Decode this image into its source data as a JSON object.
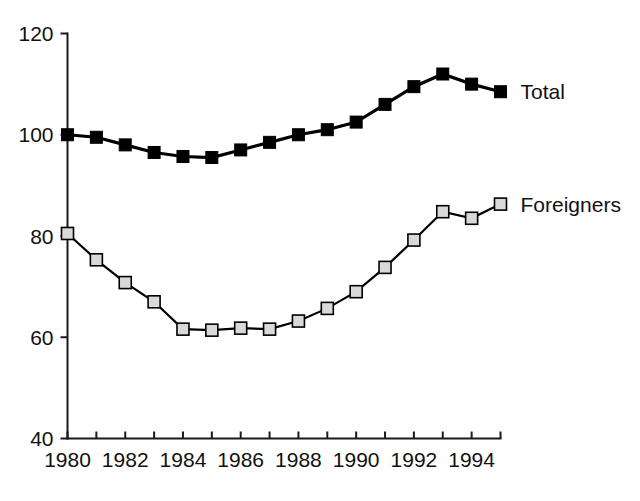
{
  "chart_data": {
    "type": "line",
    "title": "",
    "subtitle": "",
    "xlabel": "",
    "ylabel": "",
    "xlim": [
      1980,
      1995
    ],
    "ylim": [
      40,
      120
    ],
    "yticks": [
      40,
      60,
      80,
      100,
      120
    ],
    "ytick_labels": [
      "40",
      "60",
      "80",
      "100",
      "120"
    ],
    "x": [
      1980,
      1981,
      1982,
      1983,
      1984,
      1985,
      1986,
      1987,
      1988,
      1989,
      1990,
      1991,
      1992,
      1993,
      1994,
      1995
    ],
    "xticks": [
      1980,
      1981,
      1982,
      1983,
      1984,
      1985,
      1986,
      1987,
      1988,
      1989,
      1990,
      1991,
      1992,
      1993,
      1994,
      1995
    ],
    "xtick_labels": [
      "1980",
      "",
      "1982",
      "",
      "1984",
      "",
      "1986",
      "",
      "1988",
      "",
      "1990",
      "",
      "1992",
      "",
      "1994",
      ""
    ],
    "grid": false,
    "legend_position": "inline-right",
    "series": [
      {
        "name": "Total",
        "marker": "filled-square",
        "marker_color": "#000000",
        "line_color": "#000000",
        "label_x": 1995.9,
        "label_y": 108.0,
        "values": [
          100.0,
          99.5,
          98.0,
          96.5,
          95.7,
          95.5,
          97.0,
          98.5,
          100.0,
          101.0,
          102.5,
          106.0,
          109.5,
          112.0,
          110.0,
          108.5
        ]
      },
      {
        "name": "Foreigners",
        "marker": "open-square",
        "marker_color": "#d9d9d9",
        "line_color": "#000000",
        "label_x": 1995.9,
        "label_y": 88.0,
        "values": [
          80.5,
          75.3,
          70.8,
          67.0,
          61.6,
          61.4,
          61.8,
          61.6,
          63.2,
          65.7,
          69.0,
          73.8,
          79.2,
          84.8,
          83.5,
          86.3
        ]
      }
    ]
  },
  "legend": {
    "entries": [
      {
        "label": "Total"
      },
      {
        "label": "Foreigners"
      }
    ]
  },
  "colors": {
    "axis": "#1a1a1a",
    "text": "#111111",
    "total_marker": "#000000",
    "foreigners_marker": "#d9d9d9",
    "background": "#ffffff"
  }
}
